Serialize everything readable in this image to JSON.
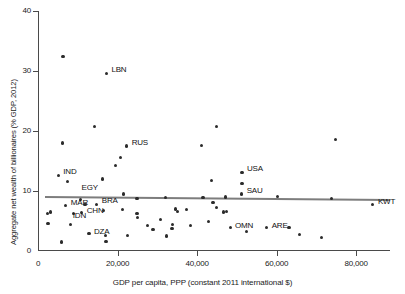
{
  "chart_data": {
    "type": "scatter",
    "title": "",
    "xlabel": "GDP per capita, PPP (constant 2011 international $)",
    "ylabel": "Aggregate net wealth of billionaires (% GDP, 2012)",
    "xlim": [
      0,
      88500
    ],
    "ylim": [
      0,
      40
    ],
    "grid": false,
    "legend": null,
    "xticks": [
      {
        "value": 0,
        "label": "0"
      },
      {
        "value": 20000,
        "label": "20,000"
      },
      {
        "value": 40000,
        "label": "40,000"
      },
      {
        "value": 60000,
        "label": "60,000"
      },
      {
        "value": 80000,
        "label": "80,000"
      }
    ],
    "yticks": [
      {
        "value": 0,
        "label": "0"
      },
      {
        "value": 10,
        "label": "10"
      },
      {
        "value": 20,
        "label": "20"
      },
      {
        "value": 30,
        "label": "30"
      },
      {
        "value": 40,
        "label": "40"
      }
    ],
    "reference_line": {
      "name": "world-average-line",
      "x_start": 1800,
      "y_start": 9.2,
      "x_end": 88500,
      "y_end": 8.7,
      "color": "#7d7d7d"
    },
    "point_color": "#2b2b2b",
    "points": [
      {
        "label": "",
        "x": 6300,
        "y": 32.4
      },
      {
        "label": "LBN",
        "x": 17200,
        "y": 29.6,
        "label_dx": 5,
        "label_dy": -3
      },
      {
        "label": "",
        "x": 14200,
        "y": 20.8
      },
      {
        "label": "",
        "x": 6200,
        "y": 18.0
      },
      {
        "label": "",
        "x": 44800,
        "y": 20.8
      },
      {
        "label": "",
        "x": 74800,
        "y": 18.6
      },
      {
        "label": "RUS",
        "x": 22300,
        "y": 17.5,
        "label_dx": 5,
        "label_dy": -3
      },
      {
        "label": "",
        "x": 41200,
        "y": 17.6
      },
      {
        "label": "",
        "x": 20800,
        "y": 15.6
      },
      {
        "label": "",
        "x": 19500,
        "y": 14.2
      },
      {
        "label": "IND",
        "x": 5100,
        "y": 12.6,
        "label_dx": 5,
        "label_dy": -3
      },
      {
        "label": "",
        "x": 7400,
        "y": 11.6
      },
      {
        "label": "",
        "x": 16300,
        "y": 12.0
      },
      {
        "label": "USA",
        "x": 51300,
        "y": 13.1,
        "label_dx": 5,
        "label_dy": -3
      },
      {
        "label": "",
        "x": 51300,
        "y": 11.3
      },
      {
        "label": "",
        "x": 43600,
        "y": 11.7
      },
      {
        "label": "SAU",
        "x": 51200,
        "y": 9.5,
        "label_dx": 5,
        "label_dy": -3
      },
      {
        "label": "EGY",
        "x": 10700,
        "y": 8.6,
        "label_dx": 1,
        "label_dy": -11
      },
      {
        "label": "",
        "x": 21500,
        "y": 9.5
      },
      {
        "label": "",
        "x": 24900,
        "y": 8.8
      },
      {
        "label": "",
        "x": 32000,
        "y": 8.9
      },
      {
        "label": "",
        "x": 41500,
        "y": 8.9
      },
      {
        "label": "",
        "x": 47200,
        "y": 9.0
      },
      {
        "label": "",
        "x": 60200,
        "y": 9.1
      },
      {
        "label": "",
        "x": 73800,
        "y": 8.8
      },
      {
        "label": "BRA",
        "x": 14800,
        "y": 7.8,
        "label_dx": 5,
        "label_dy": -3
      },
      {
        "label": "MAR",
        "x": 7000,
        "y": 7.6,
        "label_dx": 5,
        "label_dy": -2
      },
      {
        "label": "",
        "x": 11800,
        "y": 7.7
      },
      {
        "label": "CHN",
        "x": 11000,
        "y": 6.4,
        "label_dx": 5,
        "label_dy": -2
      },
      {
        "label": "IDN",
        "x": 9000,
        "y": 6.2,
        "label_dx": -1,
        "label_dy": 2
      },
      {
        "label": "",
        "x": 3200,
        "y": 6.5
      },
      {
        "label": "",
        "x": 2300,
        "y": 6.3
      },
      {
        "label": "",
        "x": 2500,
        "y": 4.6
      },
      {
        "label": "",
        "x": 8200,
        "y": 4.4
      },
      {
        "label": "",
        "x": 16400,
        "y": 6.8
      },
      {
        "label": "",
        "x": 21200,
        "y": 6.9
      },
      {
        "label": "",
        "x": 24900,
        "y": 6.3
      },
      {
        "label": "",
        "x": 25100,
        "y": 5.6
      },
      {
        "label": "",
        "x": 30800,
        "y": 5.2
      },
      {
        "label": "",
        "x": 34600,
        "y": 7.0
      },
      {
        "label": "",
        "x": 35100,
        "y": 6.6
      },
      {
        "label": "",
        "x": 37300,
        "y": 6.9
      },
      {
        "label": "",
        "x": 44000,
        "y": 8.1
      },
      {
        "label": "",
        "x": 44900,
        "y": 7.3
      },
      {
        "label": "",
        "x": 46600,
        "y": 6.5
      },
      {
        "label": "",
        "x": 47400,
        "y": 6.6
      },
      {
        "label": "",
        "x": 42800,
        "y": 4.9
      },
      {
        "label": "",
        "x": 38300,
        "y": 4.2
      },
      {
        "label": "OMN",
        "x": 48300,
        "y": 3.9,
        "label_dx": 5,
        "label_dy": -2
      },
      {
        "label": "ARE",
        "x": 57500,
        "y": 3.9,
        "label_dx": 5,
        "label_dy": -2
      },
      {
        "label": "",
        "x": 63100,
        "y": 3.9
      },
      {
        "label": "KWT",
        "x": 84200,
        "y": 7.7,
        "label_dx": 5,
        "label_dy": -3
      },
      {
        "label": "DZA",
        "x": 12800,
        "y": 2.9,
        "label_dx": 5,
        "label_dy": -2
      },
      {
        "label": "",
        "x": 17000,
        "y": 2.6
      },
      {
        "label": "",
        "x": 17100,
        "y": 1.6
      },
      {
        "label": "",
        "x": 6000,
        "y": 1.5
      },
      {
        "label": "",
        "x": 22600,
        "y": 2.6
      },
      {
        "label": "",
        "x": 28900,
        "y": 3.6
      },
      {
        "label": "",
        "x": 32300,
        "y": 2.5
      },
      {
        "label": "",
        "x": 33800,
        "y": 4.4
      },
      {
        "label": "",
        "x": 33700,
        "y": 3.7
      },
      {
        "label": "",
        "x": 27600,
        "y": 4.2
      },
      {
        "label": "",
        "x": 52400,
        "y": 3.3
      },
      {
        "label": "",
        "x": 65800,
        "y": 2.7
      },
      {
        "label": "",
        "x": 71300,
        "y": 2.2
      }
    ]
  }
}
